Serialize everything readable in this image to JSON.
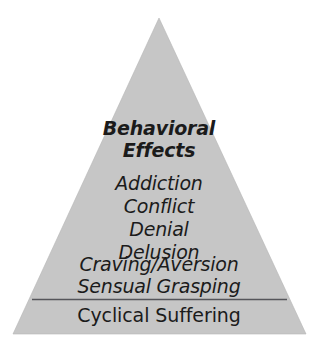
{
  "diagram": {
    "type": "pyramid",
    "shape_name": "triangle",
    "background_color": "#ffffff",
    "fill_color": "#c6c6c6",
    "edge_color": "#b5b5b5",
    "text_color": "#1b1b1b",
    "divider_color": "#55555a",
    "geometry": {
      "apex_x": 159,
      "apex_y": 18,
      "base_left_x": 13,
      "base_right_x": 306,
      "base_y": 334,
      "divider_y": 299,
      "divider_left_x": 32,
      "divider_right_x": 287
    }
  },
  "title": {
    "line_1": "Behavioral",
    "line_2": "Effects"
  },
  "effects": [
    {
      "label": "Addiction"
    },
    {
      "label": "Conflict"
    },
    {
      "label": "Denial"
    },
    {
      "label": "Delusion"
    },
    {
      "label": "Craving/Aversion"
    },
    {
      "label": "Sensual Grasping"
    }
  ],
  "base": {
    "label": "Cyclical Suffering"
  }
}
